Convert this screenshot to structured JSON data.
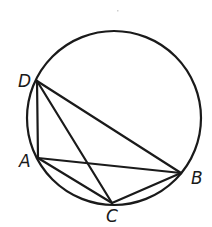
{
  "diagram": {
    "type": "inscribed-quadrilateral",
    "stroke_color": "#1a1a1a",
    "background_color": "#ffffff",
    "circle": {
      "center": [
        114,
        118
      ],
      "radius": 87
    },
    "points": [
      {
        "name": "D",
        "x": 37,
        "y": 81,
        "label": "D",
        "label_x": 18,
        "label_y": 87
      },
      {
        "name": "A",
        "x": 38,
        "y": 158,
        "label": "A",
        "label_x": 19,
        "label_y": 167
      },
      {
        "name": "C",
        "x": 112,
        "y": 203,
        "label": "C",
        "label_x": 106,
        "label_y": 222
      },
      {
        "name": "B",
        "x": 181,
        "y": 173,
        "label": "B",
        "label_x": 191,
        "label_y": 184
      }
    ],
    "segments": [
      {
        "name": "DA",
        "from": "D",
        "to": "A"
      },
      {
        "name": "DB",
        "from": "D",
        "to": "B"
      },
      {
        "name": "DC",
        "from": "D",
        "to": "C"
      },
      {
        "name": "AB",
        "from": "A",
        "to": "B"
      },
      {
        "name": "AC",
        "from": "A",
        "to": "C"
      },
      {
        "name": "CB",
        "from": "C",
        "to": "B"
      }
    ],
    "labels": {
      "D": "D",
      "A": "A",
      "C": "C",
      "B": "B"
    }
  }
}
